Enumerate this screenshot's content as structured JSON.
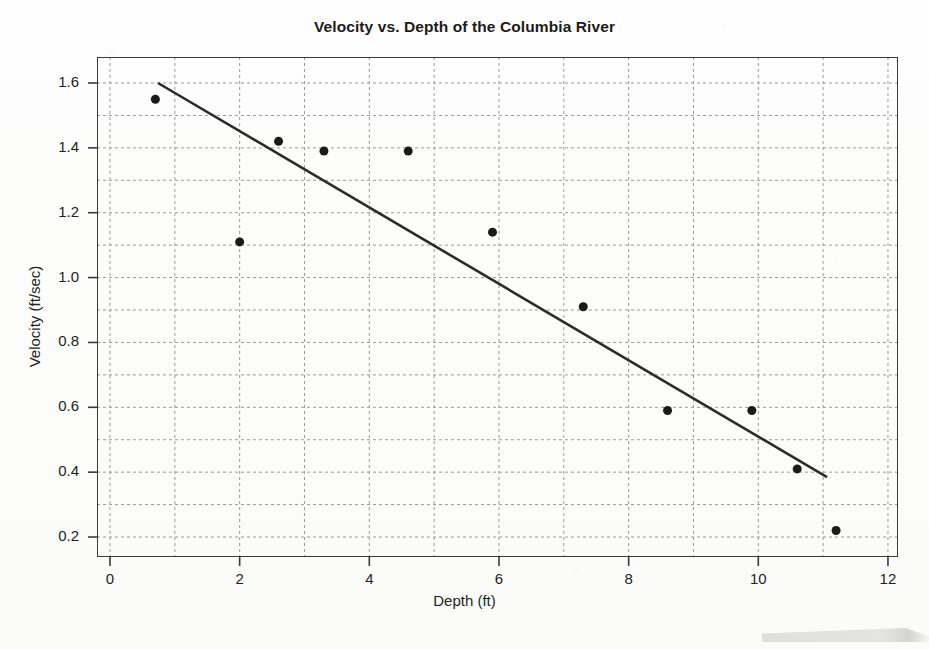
{
  "chart_data": {
    "type": "scatter",
    "title": "Velocity vs. Depth of the Columbia River",
    "xlabel": "Depth (ft)",
    "ylabel": "Velocity (ft/sec)",
    "xlim": [
      0,
      12
    ],
    "ylim": [
      0.1,
      1.7
    ],
    "grid": true,
    "legend": null,
    "x_ticks": [
      "0",
      "2",
      "4",
      "6",
      "8",
      "10",
      "12"
    ],
    "x_tick_values": [
      0,
      2,
      4,
      6,
      8,
      10,
      12
    ],
    "x_minor_gridline_step": 1,
    "y_ticks": [
      "0.2",
      "0.4",
      "0.6",
      "0.8",
      "1.0",
      "1.2",
      "1.4",
      "1.6"
    ],
    "y_tick_values": [
      0.2,
      0.4,
      0.6,
      0.8,
      1.0,
      1.2,
      1.4,
      1.6
    ],
    "y_minor_gridline_step": 0.1,
    "points": [
      {
        "x": 0.7,
        "y": 1.55
      },
      {
        "x": 2.0,
        "y": 1.11
      },
      {
        "x": 2.6,
        "y": 1.42
      },
      {
        "x": 3.3,
        "y": 1.39
      },
      {
        "x": 4.6,
        "y": 1.39
      },
      {
        "x": 5.9,
        "y": 1.14
      },
      {
        "x": 7.3,
        "y": 0.91
      },
      {
        "x": 8.6,
        "y": 0.59
      },
      {
        "x": 9.9,
        "y": 0.59
      },
      {
        "x": 10.6,
        "y": 0.41
      },
      {
        "x": 11.2,
        "y": 0.22
      }
    ],
    "marker": {
      "shape": "circle",
      "color": "#1a1a1a",
      "size": 9
    },
    "trendline": {
      "type": "linear-fit",
      "color": "#2b2b2b",
      "width": 2.6,
      "x_start": 0.74,
      "y_start": 1.6,
      "x_end": 11.06,
      "y_end": 0.385
    },
    "axis_color": "#3c3a38",
    "gridline_color": "#9a9a9a"
  }
}
